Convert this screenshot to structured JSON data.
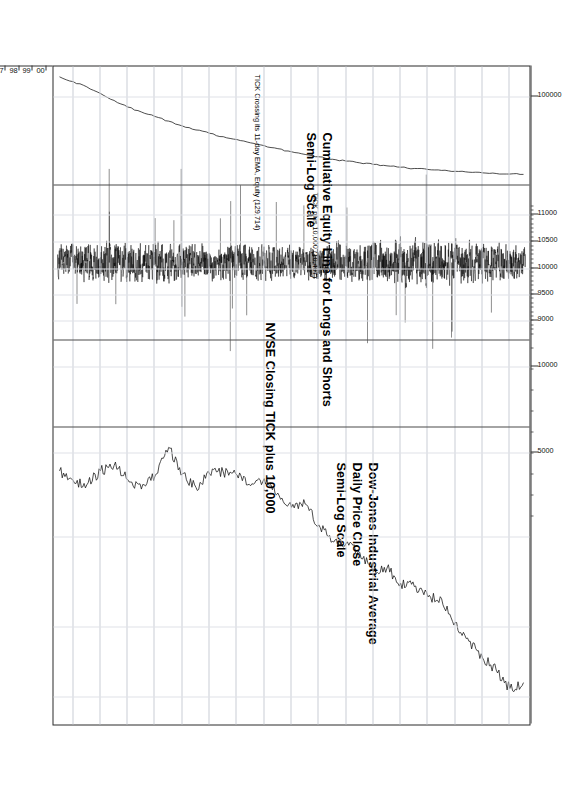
{
  "figure": {
    "orientation": "landscape-rotated-90",
    "background": "#ffffff",
    "frame_color": "#2b2b2b",
    "grid_color": "#c9cdd6"
  },
  "annotations": {
    "equity_note": "TICK Crossing its 11-day EMA,  Equity (129,714)",
    "panel1_title_line1": "Cumulative Equity Line for Longs and Shorts",
    "panel1_title_line2": "Semi-Log Scale",
    "tick_note": "TICK plus 10,000 (10,407)",
    "panel2_title": "NYSE Closing TICK plus 10,000",
    "panel3_title_line1": "Dow-Jones Industrial Average",
    "panel3_title_line2": "Daily Price Close",
    "panel3_title_line3": "Semi-Log Scale"
  },
  "chart_data": {
    "type": "line",
    "title": "NYSE Closing TICK plus 10,000",
    "subtitle": "Cumulative Equity Line for Longs and Shorts / Dow-Jones Industrial Average",
    "xlabel": "",
    "ylabel": "",
    "grid": true,
    "legend": "none",
    "x": [
      "66",
      "67",
      "68",
      "69",
      "70",
      "71",
      "72",
      "73",
      "74",
      "75",
      "76",
      "77",
      "78",
      "79",
      "80",
      "81",
      "82",
      "83",
      "84",
      "85",
      "86",
      "87",
      "88",
      "89",
      "90",
      "91",
      "92",
      "93",
      "94",
      "95",
      "96",
      "97",
      "98",
      "99",
      "00"
    ],
    "xlim": [
      "66",
      "00"
    ],
    "panels": [
      {
        "name": "cumulative-equity",
        "title": "Cumulative Equity Line for Longs and Shorts",
        "scale": "Semi-Log Scale",
        "note": "TICK Crossing its 11-day EMA,  Equity (129,714)",
        "tick_labels": [
          "100000"
        ],
        "tick_values": [
          100000
        ],
        "final_value": 129714,
        "series": [
          {
            "name": "Cumulative Equity",
            "x": [
              "66",
              "67",
              "68",
              "69",
              "70",
              "71",
              "72",
              "73",
              "74",
              "75",
              "76",
              "77",
              "78",
              "79",
              "80",
              "81",
              "82",
              "83",
              "84",
              "85",
              "86",
              "87",
              "88",
              "89",
              "90",
              "91",
              "92",
              "93",
              "94",
              "95",
              "96",
              "97",
              "98",
              "99",
              "00"
            ],
            "values": [
              900,
              1150,
              1500,
              2100,
              3000,
              4200,
              5400,
              6800,
              8600,
              11000,
              13500,
              16000,
              19000,
              22000,
              26000,
              30000,
              35000,
              41000,
              47000,
              53000,
              60000,
              66000,
              72000,
              78000,
              84000,
              90000,
              96000,
              101000,
              106000,
              111000,
              116000,
              120000,
              124000,
              127500,
              129714
            ]
          }
        ]
      },
      {
        "name": "nyse-closing-tick",
        "title": "NYSE Closing TICK plus 10,000",
        "note": "TICK plus 10,000 (10,407)",
        "tick_labels": [
          "11000",
          "10500",
          "10000",
          "9500",
          "9000"
        ],
        "tick_values": [
          11000,
          10500,
          10000,
          9500,
          9000
        ],
        "final_value": 10407,
        "series": [
          {
            "name": "NYSE Closing TICK + 10,000",
            "description": "dense daily oscillator, mean ~10,000, range ~9,000-11,000",
            "mean": 10000,
            "min": 8900,
            "max": 11100
          }
        ]
      },
      {
        "name": "dow-jones-industrial-average",
        "title": "Dow-Jones Industrial Average",
        "subtitle": "Daily Price Close",
        "scale": "Semi-Log Scale",
        "tick_labels": [
          "10000",
          "5000"
        ],
        "tick_values": [
          10000,
          5000
        ],
        "series": [
          {
            "name": "DJIA Daily Close",
            "x": [
              "66",
              "67",
              "68",
              "69",
              "70",
              "71",
              "72",
              "73",
              "74",
              "75",
              "76",
              "77",
              "78",
              "79",
              "80",
              "81",
              "82",
              "83",
              "84",
              "85",
              "86",
              "87",
              "88",
              "89",
              "90",
              "91",
              "92",
              "93",
              "94",
              "95",
              "96",
              "97",
              "98",
              "99",
              "00"
            ],
            "values": [
              800,
              900,
              950,
              800,
              750,
              890,
              1000,
              850,
              600,
              830,
              980,
              830,
              810,
              840,
              960,
              880,
              1050,
              1250,
              1200,
              1550,
              1900,
              1940,
              2170,
              2750,
              2630,
              3170,
              3300,
              3750,
              3830,
              5120,
              6450,
              7900,
              9180,
              11500,
              10700
            ]
          }
        ]
      }
    ]
  },
  "axes": {
    "value_axis_labels": [
      "100000",
      "11000",
      "10500",
      "10000",
      "9500",
      "9000",
      "10000",
      "5000"
    ],
    "year_axis_labels": [
      "66",
      "67",
      "68",
      "69",
      "70",
      "71",
      "72",
      "73",
      "74",
      "75",
      "76",
      "77",
      "78",
      "79",
      "80",
      "81",
      "82",
      "83",
      "84",
      "85",
      "86",
      "87",
      "88",
      "89",
      "90",
      "91",
      "92",
      "93",
      "94",
      "95",
      "96",
      "97",
      "98",
      "99",
      "00"
    ]
  }
}
